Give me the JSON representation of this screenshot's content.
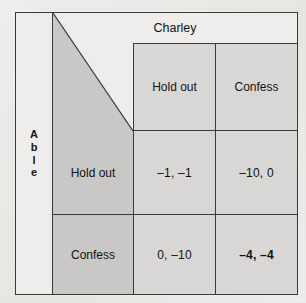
{
  "figure": {
    "kind": "payoff-matrix",
    "column_player": "Charley",
    "row_player_letters": [
      "A",
      "b",
      "l",
      "e"
    ],
    "row_player": "Able"
  },
  "columns": [
    {
      "label": "Hold out"
    },
    {
      "label": "Confess"
    }
  ],
  "rows": [
    {
      "label": "Hold out"
    },
    {
      "label": "Confess"
    }
  ],
  "cells": [
    [
      {
        "text": "–1, –1",
        "row": "Hold out",
        "column": "Hold out",
        "able_payoff": -1,
        "charley_payoff": -1,
        "equilibrium": false
      },
      {
        "text": "–10, 0",
        "row": "Hold out",
        "column": "Confess",
        "able_payoff": -10,
        "charley_payoff": 0,
        "equilibrium": false
      }
    ],
    [
      {
        "text": "0, –10",
        "row": "Confess",
        "column": "Hold out",
        "able_payoff": 0,
        "charley_payoff": -10,
        "equilibrium": false
      },
      {
        "text": "–4, –4",
        "row": "Confess",
        "column": "Confess",
        "able_payoff": -4,
        "charley_payoff": -4,
        "equilibrium": true
      }
    ]
  ],
  "colors": {
    "border": "#3a3a3a",
    "header_band": "#eeedec",
    "label_shade": "#c9c8c6",
    "cell_shade": "#d8d7d5",
    "page": "#f2f1ef",
    "text": "#131313"
  }
}
